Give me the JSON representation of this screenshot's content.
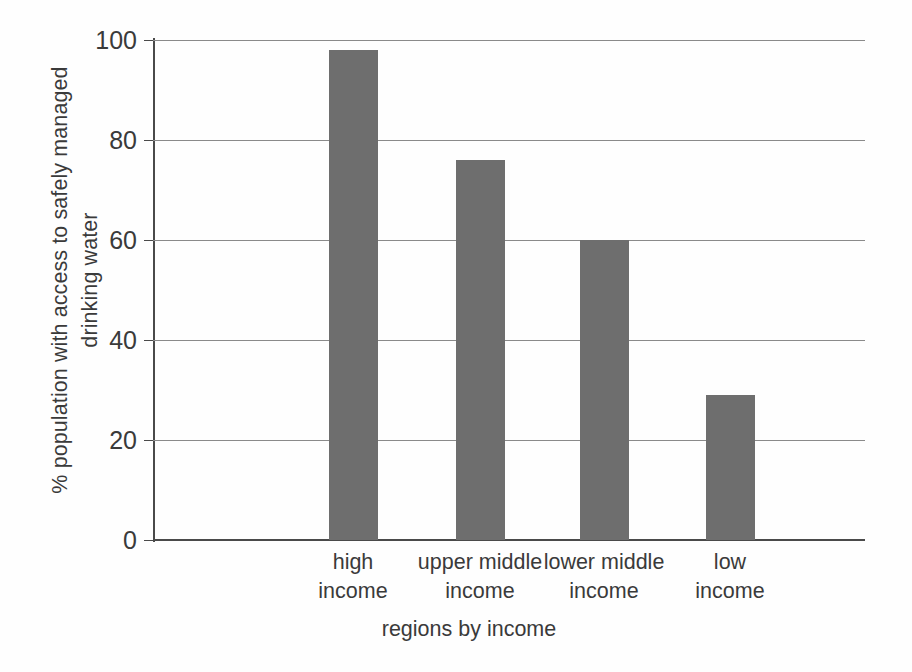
{
  "chart_data": {
    "type": "bar",
    "title": "",
    "xlabel": "regions by income",
    "ylabel": "% population with access to safely managed drinking water",
    "ylabel_lines": [
      "% population with access to safely managed",
      "drinking water"
    ],
    "categories": [
      "high income",
      "upper middle income",
      "lower middle income",
      "low income"
    ],
    "category_lines": [
      [
        "high",
        "income"
      ],
      [
        "upper middle",
        "income"
      ],
      [
        "lower middle",
        "income"
      ],
      [
        "low",
        "income"
      ]
    ],
    "values": [
      98,
      76,
      60,
      29
    ],
    "ylim": [
      0,
      100
    ],
    "yticks": [
      0,
      20,
      40,
      60,
      80,
      100
    ],
    "ytick_labels": [
      "0",
      "20",
      "40",
      "60",
      "80",
      "100"
    ],
    "grid": true,
    "grid_axis": "y",
    "legend": false,
    "bar_color": "#6e6e6e",
    "axis_color": "#4a4a4a",
    "grid_color": "#8a8a8a",
    "text_color": "#3a3a3a",
    "background_color": "#fefefe"
  }
}
